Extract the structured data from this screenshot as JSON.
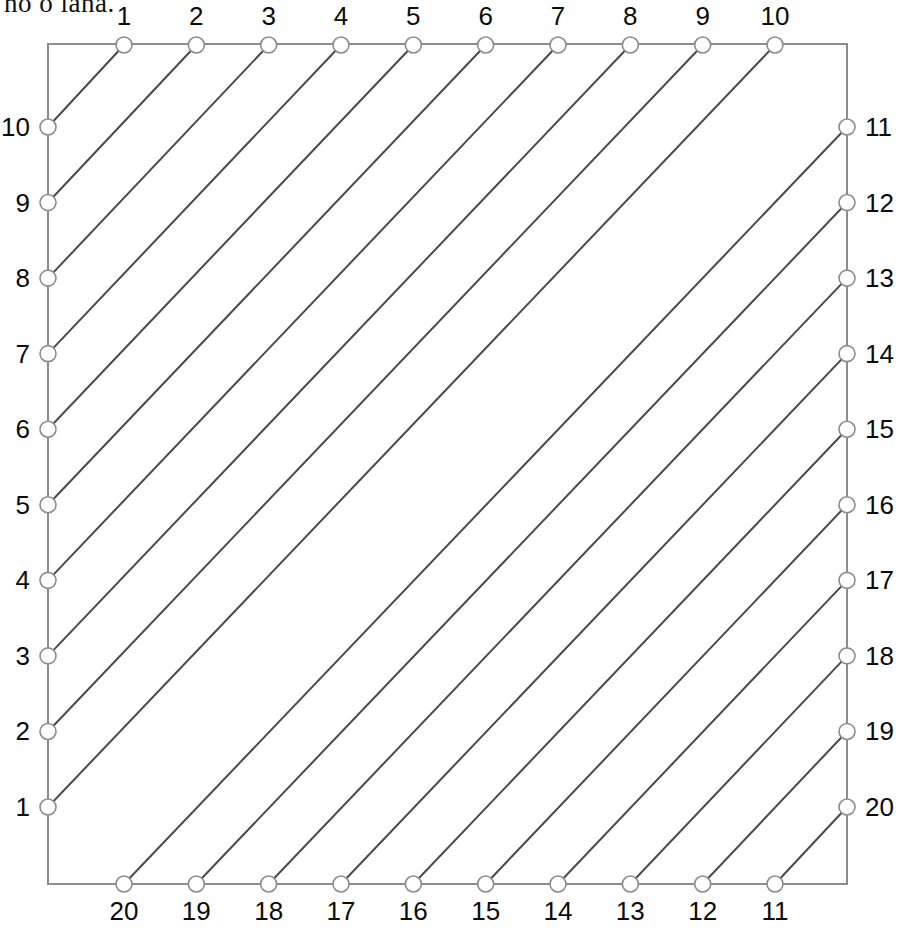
{
  "page": {
    "width": 904,
    "height": 932,
    "background": "#ffffff",
    "cut_off_text": "no o lana."
  },
  "figure": {
    "title": "",
    "type": "string-art-envelope",
    "frame": {
      "left": 48,
      "top": 44,
      "right": 847,
      "bottom": 884,
      "stroke_color": "#8c8c8c",
      "stroke_width": 2
    },
    "style": {
      "line_color": "#4a4a4a",
      "line_width": 2,
      "node_stroke": "#8c8c8c",
      "node_fill": "#ffffff",
      "node_radius": 8,
      "node_stroke_width": 1.6
    },
    "geometry": {
      "top_y": 45,
      "bottom_y": 884,
      "left_x": 48,
      "right_x": 847,
      "first_col_x": 124,
      "last_col_x": 775,
      "first_row_y": 127,
      "last_row_y": 807,
      "count_per_side": 10
    }
  },
  "chart_data": {
    "type": "line",
    "title": "",
    "xlabel": "",
    "ylabel": "",
    "axes": {
      "top": {
        "name": "top-axis",
        "orientation": "horizontal",
        "direction": "left-to-right",
        "labels": [
          "1",
          "2",
          "3",
          "4",
          "5",
          "6",
          "7",
          "8",
          "9",
          "10"
        ]
      },
      "left": {
        "name": "left-axis",
        "orientation": "vertical",
        "direction": "top-to-bottom",
        "labels": [
          "10",
          "9",
          "8",
          "7",
          "6",
          "5",
          "4",
          "3",
          "2",
          "1"
        ]
      },
      "right": {
        "name": "right-axis",
        "orientation": "vertical",
        "direction": "top-to-bottom",
        "labels": [
          "11",
          "12",
          "13",
          "14",
          "15",
          "16",
          "17",
          "18",
          "19",
          "20"
        ]
      },
      "bottom": {
        "name": "bottom-axis",
        "orientation": "horizontal",
        "direction": "left-to-right",
        "labels": [
          "20",
          "19",
          "18",
          "17",
          "16",
          "15",
          "14",
          "13",
          "12",
          "11"
        ]
      }
    },
    "nodes": {
      "top": [
        {
          "label": "1",
          "x": 124,
          "y": 45
        },
        {
          "label": "2",
          "x": 196,
          "y": 45
        },
        {
          "label": "3",
          "x": 269,
          "y": 45
        },
        {
          "label": "4",
          "x": 341,
          "y": 45
        },
        {
          "label": "5",
          "x": 413,
          "y": 45
        },
        {
          "label": "6",
          "x": 486,
          "y": 45
        },
        {
          "label": "7",
          "x": 558,
          "y": 45
        },
        {
          "label": "8",
          "x": 630,
          "y": 45
        },
        {
          "label": "9",
          "x": 703,
          "y": 45
        },
        {
          "label": "10",
          "x": 775,
          "y": 45
        }
      ],
      "left": [
        {
          "label": "10",
          "x": 48,
          "y": 127
        },
        {
          "label": "9",
          "x": 48,
          "y": 203
        },
        {
          "label": "8",
          "x": 48,
          "y": 278
        },
        {
          "label": "7",
          "x": 48,
          "y": 354
        },
        {
          "label": "6",
          "x": 48,
          "y": 429
        },
        {
          "label": "5",
          "x": 48,
          "y": 505
        },
        {
          "label": "4",
          "x": 48,
          "y": 580
        },
        {
          "label": "3",
          "x": 48,
          "y": 656
        },
        {
          "label": "2",
          "x": 48,
          "y": 731
        },
        {
          "label": "1",
          "x": 48,
          "y": 807
        }
      ],
      "right": [
        {
          "label": "11",
          "x": 847,
          "y": 127
        },
        {
          "label": "12",
          "x": 847,
          "y": 203
        },
        {
          "label": "13",
          "x": 847,
          "y": 278
        },
        {
          "label": "14",
          "x": 847,
          "y": 354
        },
        {
          "label": "15",
          "x": 847,
          "y": 429
        },
        {
          "label": "16",
          "x": 847,
          "y": 505
        },
        {
          "label": "17",
          "x": 847,
          "y": 580
        },
        {
          "label": "18",
          "x": 847,
          "y": 656
        },
        {
          "label": "19",
          "x": 847,
          "y": 731
        },
        {
          "label": "20",
          "x": 847,
          "y": 807
        }
      ],
      "bottom": [
        {
          "label": "20",
          "x": 124,
          "y": 884
        },
        {
          "label": "19",
          "x": 196,
          "y": 884
        },
        {
          "label": "18",
          "x": 269,
          "y": 884
        },
        {
          "label": "17",
          "x": 341,
          "y": 884
        },
        {
          "label": "16",
          "x": 486,
          "y": 884
        },
        {
          "label": "15",
          "x": 486,
          "y": 884
        },
        {
          "label": "14",
          "x": 558,
          "y": 884
        },
        {
          "label": "13",
          "x": 630,
          "y": 884
        },
        {
          "label": "12",
          "x": 703,
          "y": 884
        },
        {
          "label": "11",
          "x": 775,
          "y": 884
        }
      ]
    },
    "chords": {
      "upper_left_family": {
        "note": "Top anchor k joins Left anchor k (left labels counted downward 10..1); envelopes the upper-left parabolic arc.",
        "pairs": [
          [
            1,
            1
          ],
          [
            2,
            2
          ],
          [
            3,
            3
          ],
          [
            4,
            4
          ],
          [
            5,
            5
          ],
          [
            6,
            6
          ],
          [
            7,
            7
          ],
          [
            8,
            8
          ],
          [
            9,
            9
          ],
          [
            10,
            10
          ]
        ]
      },
      "lower_right_family": {
        "note": "Bottom anchor k joins Right anchor k (bottom labels 20..11 left-to-right, right labels 11..20 downward); envelopes the lower-right parabolic arc.",
        "pairs": [
          [
            1,
            1
          ],
          [
            2,
            2
          ],
          [
            3,
            3
          ],
          [
            4,
            4
          ],
          [
            5,
            5
          ],
          [
            6,
            6
          ],
          [
            7,
            7
          ],
          [
            8,
            8
          ],
          [
            9,
            9
          ],
          [
            10,
            10
          ]
        ]
      }
    },
    "legend": [],
    "grid": false,
    "annotations": []
  },
  "labels": {
    "top": [
      "1",
      "2",
      "3",
      "4",
      "5",
      "6",
      "7",
      "8",
      "9",
      "10"
    ],
    "left": [
      "10",
      "9",
      "8",
      "7",
      "6",
      "5",
      "4",
      "3",
      "2",
      "1"
    ],
    "right": [
      "11",
      "12",
      "13",
      "14",
      "15",
      "16",
      "17",
      "18",
      "19",
      "20"
    ],
    "bottom": [
      "20",
      "19",
      "18",
      "17",
      "16",
      "15",
      "14",
      "13",
      "12",
      "11"
    ]
  }
}
